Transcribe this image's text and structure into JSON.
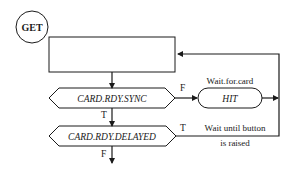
{
  "diagram": {
    "start_node": {
      "label": "GET"
    },
    "process_box": {
      "label": ""
    },
    "decision_sync": {
      "label": "CARD.RDY.SYNC",
      "true_label": "T",
      "false_label": "F"
    },
    "wait_node": {
      "label": "HIT",
      "caption": "Wait.for.card"
    },
    "decision_delayed": {
      "label": "CARD.RDY.DELAYED",
      "true_label": "T",
      "false_label": "F"
    },
    "loop_caption": {
      "line1": "Wait until button",
      "line2": "is raised"
    },
    "colors": {
      "stroke": "#1a1a1a",
      "background": "#ffffff"
    }
  }
}
